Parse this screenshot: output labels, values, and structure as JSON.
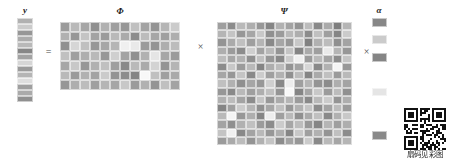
{
  "figure": {
    "title": "",
    "caption": "",
    "equation_text": "y = Φ × Ψ × α"
  },
  "labels": {
    "y": "y",
    "phi": "Φ",
    "psi": "Ψ",
    "alpha": "α"
  },
  "operators": {
    "equals": "=",
    "times_1": "×",
    "times_2": "×"
  },
  "qr": {
    "caption": "扇码见彩图",
    "caption_text": "扇码见彩图"
  },
  "colors": {
    "background": "#ffffff",
    "grid_line": "#ffffff",
    "text": "#1a1a1a",
    "operator": "#4a4a4a",
    "qr_dark": "#111111"
  },
  "chart_data": {
    "type": "heatmap",
    "title": "",
    "xlabel": "",
    "ylabel": "",
    "grid": true,
    "legend": "none",
    "colormap": "grayscale",
    "value_range": [
      0,
      1
    ],
    "panels": [
      {
        "name": "y",
        "label": "y",
        "rows": 14,
        "cols": 1,
        "values": [
          [
            0.58
          ],
          [
            0.72
          ],
          [
            0.44
          ],
          [
            0.55
          ],
          [
            0.62
          ],
          [
            0.35
          ],
          [
            0.5
          ],
          [
            0.78
          ],
          [
            0.46
          ],
          [
            0.6
          ],
          [
            0.82
          ],
          [
            0.48
          ],
          [
            0.54
          ],
          [
            0.4
          ]
        ]
      },
      {
        "name": "phi",
        "label": "Φ",
        "rows": 7,
        "cols": 12,
        "values": [
          [
            0.46,
            0.62,
            0.52,
            0.4,
            0.58,
            0.48,
            0.44,
            0.66,
            0.5,
            0.42,
            0.6,
            0.72
          ],
          [
            0.58,
            0.44,
            0.68,
            0.5,
            0.46,
            0.62,
            0.54,
            0.38,
            0.64,
            0.52,
            0.48,
            0.56
          ],
          [
            0.4,
            0.78,
            0.66,
            0.44,
            0.52,
            0.6,
            0.92,
            0.88,
            0.46,
            0.42,
            0.56,
            0.64
          ],
          [
            0.66,
            0.48,
            0.56,
            0.62,
            0.44,
            0.74,
            0.5,
            0.4,
            0.58,
            0.86,
            0.52,
            0.46
          ],
          [
            0.52,
            0.7,
            0.44,
            0.58,
            0.66,
            0.48,
            0.36,
            0.62,
            0.54,
            0.76,
            0.42,
            0.6
          ],
          [
            0.62,
            0.46,
            0.58,
            0.5,
            0.72,
            0.42,
            0.38,
            0.34,
            0.96,
            0.66,
            0.48,
            0.54
          ],
          [
            0.44,
            0.56,
            0.64,
            0.48,
            0.6,
            0.52,
            0.7,
            0.46,
            0.58,
            0.42,
            0.66,
            0.5
          ]
        ]
      },
      {
        "name": "psi",
        "label": "Ψ",
        "rows": 15,
        "cols": 14,
        "values": [
          [
            0.48,
            0.38,
            0.62,
            0.56,
            0.44,
            0.34,
            0.58,
            0.5,
            0.42,
            0.64,
            0.36,
            0.54,
            0.3,
            0.6
          ],
          [
            0.6,
            0.68,
            0.44,
            0.52,
            0.7,
            0.4,
            0.46,
            0.62,
            0.56,
            0.38,
            0.66,
            0.48,
            0.34,
            0.72
          ],
          [
            0.42,
            0.54,
            0.66,
            0.48,
            0.6,
            0.36,
            0.52,
            0.44,
            0.7,
            0.32,
            0.58,
            0.64,
            0.4,
            0.5
          ],
          [
            0.56,
            0.46,
            0.38,
            0.74,
            0.5,
            0.62,
            0.42,
            0.68,
            0.34,
            0.54,
            0.48,
            0.88,
            0.6,
            0.44
          ],
          [
            0.64,
            0.52,
            0.58,
            0.4,
            0.66,
            0.44,
            0.36,
            0.72,
            0.92,
            0.46,
            0.62,
            0.5,
            0.38,
            0.68
          ],
          [
            0.38,
            0.7,
            0.46,
            0.62,
            0.34,
            0.56,
            0.64,
            0.42,
            0.5,
            0.78,
            0.36,
            0.58,
            0.94,
            0.44
          ],
          [
            0.52,
            0.44,
            0.68,
            0.36,
            0.72,
            0.48,
            0.58,
            0.4,
            0.64,
            0.34,
            0.54,
            0.66,
            0.46,
            0.62
          ],
          [
            0.66,
            0.58,
            0.4,
            0.52,
            0.44,
            0.74,
            0.36,
            0.9,
            0.48,
            0.6,
            0.42,
            0.38,
            0.56,
            0.5
          ],
          [
            0.44,
            0.36,
            0.62,
            0.48,
            0.56,
            0.66,
            0.42,
            0.96,
            0.34,
            0.52,
            0.7,
            0.46,
            0.64,
            0.4
          ],
          [
            0.58,
            0.64,
            0.5,
            0.38,
            0.68,
            0.44,
            0.54,
            0.6,
            0.46,
            0.36,
            0.62,
            0.72,
            0.42,
            0.56
          ],
          [
            0.34,
            0.48,
            0.72,
            0.6,
            0.4,
            0.52,
            0.66,
            0.44,
            0.58,
            0.68,
            0.38,
            0.5,
            0.64,
            0.46
          ],
          [
            0.62,
            0.94,
            0.44,
            0.56,
            0.34,
            0.9,
            0.48,
            0.62,
            0.4,
            0.54,
            0.66,
            0.36,
            0.58,
            0.7
          ],
          [
            0.5,
            0.4,
            0.58,
            0.66,
            0.46,
            0.38,
            0.72,
            0.52,
            0.64,
            0.44,
            0.34,
            0.6,
            0.48,
            0.56
          ],
          [
            0.68,
            0.92,
            0.36,
            0.5,
            0.62,
            0.44,
            0.56,
            0.34,
            0.7,
            0.48,
            0.58,
            0.42,
            0.66,
            0.38
          ],
          [
            0.46,
            0.54,
            0.64,
            0.42,
            0.58,
            0.68,
            0.38,
            0.5,
            0.44,
            0.72,
            0.36,
            0.62,
            0.52,
            0.6
          ]
        ]
      },
      {
        "name": "alpha",
        "label": "α",
        "rows": 14,
        "cols": 1,
        "sparse": true,
        "values": [
          [
            0.35
          ],
          [
            1.0
          ],
          [
            0.72
          ],
          [
            1.0
          ],
          [
            0.34
          ],
          [
            1.0
          ],
          [
            1.0
          ],
          [
            1.0
          ],
          [
            0.86
          ],
          [
            1.0
          ],
          [
            1.0
          ],
          [
            1.0
          ],
          [
            1.0
          ],
          [
            0.36
          ]
        ]
      }
    ]
  }
}
